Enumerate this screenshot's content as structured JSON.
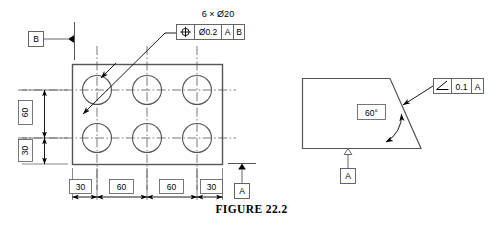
{
  "figure": {
    "caption": "FIGURE 22.2",
    "background_color": "#ffffff",
    "line_color": "#000000",
    "outline_color": "#555555"
  },
  "left_view": {
    "name": "plate-with-six-holes",
    "hole_note": "6 × Ø20",
    "feature_control_frame": {
      "symbol_name": "position-symbol",
      "tolerance": "Ø0.2",
      "primary_datum": "A",
      "secondary_datum": "B"
    },
    "datum_b_label": "B",
    "datum_a_label": "A",
    "vertical_dimensions": [
      {
        "value": "60"
      },
      {
        "value": "30"
      }
    ],
    "horizontal_dimensions": [
      {
        "value": "30"
      },
      {
        "value": "60"
      },
      {
        "value": "60"
      },
      {
        "value": "30"
      }
    ]
  },
  "right_view": {
    "name": "angled-block",
    "angle_dimension": "60°",
    "feature_control_frame": {
      "symbol_name": "angularity-symbol",
      "tolerance": "0.1",
      "primary_datum": "A"
    },
    "datum_a_label": "A"
  }
}
